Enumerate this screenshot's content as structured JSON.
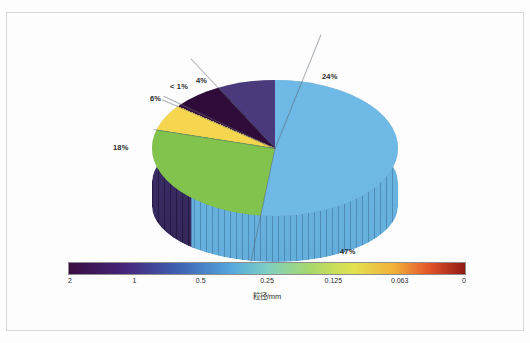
{
  "chart_data": {
    "type": "pie",
    "title": "",
    "xlabel": "",
    "ylabel": "",
    "categories": [
      "47%",
      "24%",
      "4%",
      "< 1%",
      "6%",
      "18%"
    ],
    "labels": [
      "47%",
      "24%",
      "4%",
      "< 1%",
      "6%",
      "18%"
    ],
    "values": [
      47,
      24,
      4,
      0.5,
      6,
      18
    ],
    "colors": [
      "#6fb9e6",
      "#82c34e",
      "#f5d64e",
      "#3a1040",
      "#2e0b38",
      "#4a3a7c"
    ],
    "three_d": true,
    "legend": "none",
    "grid": false,
    "slices": [
      {
        "label": "47%",
        "value": 47,
        "color": "#6fb9e6",
        "side_color": "#4f96c4"
      },
      {
        "label": "24%",
        "value": 24,
        "color": "#82c34e",
        "side_color": "#5f9238"
      },
      {
        "label": "4%",
        "value": 4,
        "color": "#f5d64e",
        "side_color": "#c3a62f"
      },
      {
        "label": "< 1%",
        "value": 0.5,
        "color": "#3a1040",
        "side_color": "#280a2c"
      },
      {
        "label": "6%",
        "value": 6,
        "color": "#2e0b38",
        "side_color": "#1f0726"
      },
      {
        "label": "18%",
        "value": 18,
        "color": "#4a3a7c",
        "side_color": "#332657"
      }
    ],
    "colorbar": {
      "label": "粒径/mm",
      "ticks": [
        "2",
        "1",
        "0.5",
        "0.25",
        "0.125",
        "0.063",
        "0"
      ],
      "tick_values": [
        2,
        1,
        0.5,
        0.25,
        0.125,
        0.063,
        0
      ],
      "orientation": "horizontal",
      "reversed": true,
      "gradient_stops": [
        "#3a0d42",
        "#46257a",
        "#3f63b4",
        "#55a8dd",
        "#7ecfc4",
        "#a8d86a",
        "#e3e24f",
        "#f2b03a",
        "#e4532a",
        "#8e1a12"
      ]
    }
  },
  "pie_labels": {
    "blue": "47%",
    "green": "24%",
    "yellow": "4%",
    "darkest": "< 1%",
    "dark_purple": "6%",
    "purple": "18%"
  },
  "colorbar_label": "粒径/mm",
  "colorbar_ticks": [
    "2",
    "1",
    "0.5",
    "0.25",
    "0.125",
    "0.063",
    "0"
  ]
}
